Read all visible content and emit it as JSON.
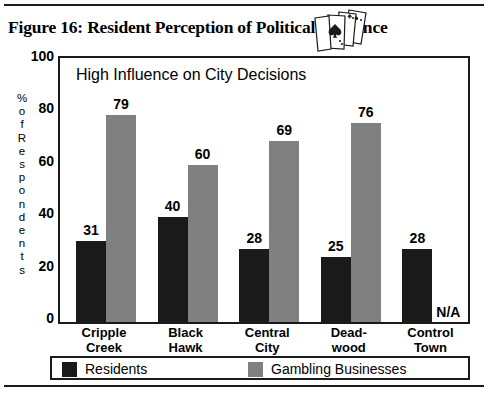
{
  "figure": {
    "caption": "Figure 16:  Resident Perception of Political Influence",
    "icon": "playing-cards-spade-icon"
  },
  "chart_data": {
    "type": "bar",
    "title": "High Influence on City Decisions",
    "xlabel": "",
    "ylabel": "% of Respondents",
    "ylim": [
      0,
      100
    ],
    "yticks": [
      0,
      20,
      40,
      60,
      80,
      100
    ],
    "grid": false,
    "legend_position": "bottom",
    "categories": [
      "Cripple Creek",
      "Black Hawk",
      "Central City",
      "Deadwood",
      "Control Town"
    ],
    "category_lines": [
      [
        "Cripple",
        "Creek"
      ],
      [
        "Black",
        "Hawk"
      ],
      [
        "Central",
        "City"
      ],
      [
        "Dead-",
        "wood"
      ],
      [
        "Control",
        "Town"
      ]
    ],
    "series": [
      {
        "name": "Residents",
        "color": "#1a1a1a",
        "values": [
          31,
          40,
          28,
          25,
          28
        ],
        "labels": [
          "31",
          "40",
          "28",
          "25",
          "28"
        ]
      },
      {
        "name": "Gambling Businesses",
        "color": "#808080",
        "values": [
          79,
          60,
          69,
          76,
          null
        ],
        "labels": [
          "79",
          "60",
          "69",
          "76",
          "N/A"
        ]
      }
    ],
    "na_marker": "N/A",
    "ylabel_chars": [
      "%",
      "o",
      "f",
      "R",
      "e",
      "s",
      "p",
      "o",
      "n",
      "d",
      "e",
      "n",
      "t",
      "s"
    ]
  },
  "colors": {
    "residents": "#1a1a1a",
    "gambling": "#808080",
    "axis": "#1a1a1a",
    "background": "#ffffff"
  }
}
